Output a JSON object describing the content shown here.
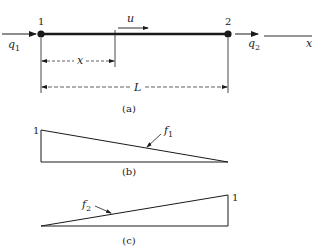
{
  "figure": {
    "panel_a": {
      "caption": "(a)",
      "node1_label": "1",
      "node2_label": "2",
      "q1_label": "q",
      "q1_sub": "1",
      "q2_label": "q",
      "q2_sub": "2",
      "u_label": "u",
      "x_dim_label": "x",
      "L_dim_label": "L",
      "axis_label": "x"
    },
    "panel_b": {
      "caption": "(b)",
      "height_label": "1",
      "curve_label": "f",
      "curve_sub": "1"
    },
    "panel_c": {
      "caption": "(c)",
      "height_label": "1",
      "curve_label": "f",
      "curve_sub": "2"
    },
    "colors": {
      "ink": "#1a1a1a",
      "background": "#ffffff"
    }
  }
}
